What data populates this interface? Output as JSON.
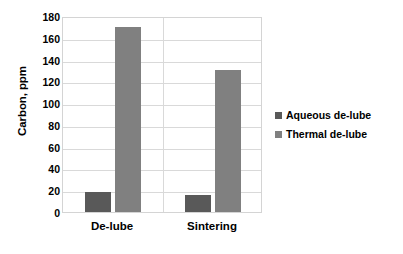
{
  "chart_data": {
    "type": "bar",
    "title": "",
    "xlabel": "",
    "ylabel": "Carbon, ppm",
    "categories": [
      "De-lube",
      "Sintering"
    ],
    "series": [
      {
        "name": "Aqueous de-lube",
        "color": "#595959",
        "values": [
          18,
          16
        ]
      },
      {
        "name": "Thermal de-lube",
        "color": "#808080",
        "values": [
          170,
          130
        ]
      }
    ],
    "ylim": [
      0,
      180
    ],
    "yticks": [
      0,
      20,
      40,
      60,
      80,
      100,
      120,
      140,
      160,
      180
    ],
    "ytick_labels": [
      "0",
      "20",
      "40",
      "60",
      "80",
      "100",
      "120",
      "140",
      "160",
      "180"
    ],
    "grid": true,
    "grid_axis": "y",
    "legend_position": "right"
  },
  "axes": {
    "y_title": "Carbon, ppm"
  },
  "legend": {
    "items": [
      {
        "label": "Aqueous de-lube",
        "color": "#595959"
      },
      {
        "label": "Thermal de-lube",
        "color": "#808080"
      }
    ]
  },
  "colors": {
    "aqueous_de_lube": "#595959",
    "thermal_de_lube": "#808080",
    "gridline": "#d9d9d9",
    "plot_border": "#d4d4d4",
    "background": "#ffffff",
    "text": "#000000"
  }
}
